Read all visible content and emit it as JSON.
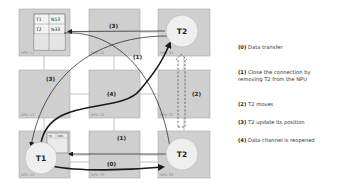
{
  "colors": {
    "npu_fill": "#cfcfcf",
    "npu_border": "#a9a9a9",
    "circle_fill": "#efefef",
    "arrow": "#1a1a1a",
    "link": "#9a9a9a"
  },
  "npus": [
    {
      "id": "npu11",
      "label": "NPU 11"
    },
    {
      "id": "npu21",
      "label": "NPU 21"
    },
    {
      "id": "npu31",
      "label": "NPU 31"
    },
    {
      "id": "npu12",
      "label": "NPU 12"
    },
    {
      "id": "npu22",
      "label": "NPU 22"
    },
    {
      "id": "npu32",
      "label": "NPU 32"
    },
    {
      "id": "npu13",
      "label": "NPU 13"
    },
    {
      "id": "npu23",
      "label": "NPU 23"
    },
    {
      "id": "npu33",
      "label": "NPU 33"
    }
  ],
  "routing_table_large": {
    "rows": [
      [
        "T1",
        "N13"
      ],
      [
        "T2",
        "N33"
      ],
      [
        "",
        ""
      ]
    ]
  },
  "routing_table_small": {
    "rows": [
      [
        "T2",
        "N33"
      ]
    ]
  },
  "tasks": {
    "t1": "T1",
    "t2_old": "T2",
    "t2_new": "T2"
  },
  "arrow_labels": {
    "a0": "(0)",
    "a1_top": "(1)",
    "a1_mid": "(1)",
    "a2": "(2)",
    "a3_top": "(3)",
    "a3_left": "(3)",
    "a4": "(4)"
  },
  "legend": [
    {
      "num": "(0)",
      "text": "Data transfer"
    },
    {
      "num": "(1)",
      "text": "Close the connection by",
      "text2": "removing T2 from the NPU"
    },
    {
      "num": "(2)",
      "text": "T2 moves"
    },
    {
      "num": "(3)",
      "text": "T2 update its position"
    },
    {
      "num": "(4)",
      "text": "Data channel is reopened"
    }
  ]
}
